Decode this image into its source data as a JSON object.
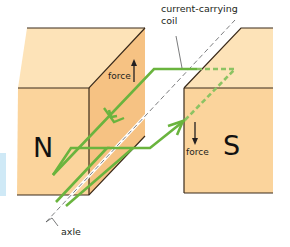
{
  "diagram": {
    "type": "electric motor principle",
    "labels": {
      "coil": "current-carrying",
      "coil_line2": "coil",
      "axle": "axle",
      "force_left": "force",
      "force_right": "force",
      "north_pole": "N",
      "south_pole": "S"
    },
    "colors": {
      "magnet_front": "#fbd49c",
      "magnet_top": "#fde3b8",
      "magnet_side": "#f6c283",
      "edge": "#3a2a1a",
      "coil": "#6ab43e",
      "coil_hidden": "#8cc363",
      "axle": "#6d6e71",
      "tab": "#cfe9f6"
    },
    "forces": {
      "left_direction": "up",
      "right_direction": "down"
    }
  }
}
